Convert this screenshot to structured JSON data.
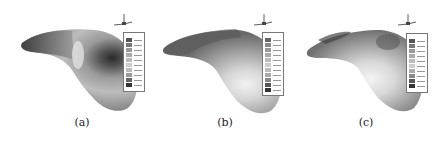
{
  "figure": {
    "panels": [
      {
        "label": "(a)",
        "legend_title": "Cp",
        "legend_entries": 10
      },
      {
        "label": "(b)",
        "legend_title": "Cp",
        "legend_entries": 11
      },
      {
        "label": "(c)",
        "legend_title": "Cp",
        "legend_entries": 10
      }
    ]
  }
}
